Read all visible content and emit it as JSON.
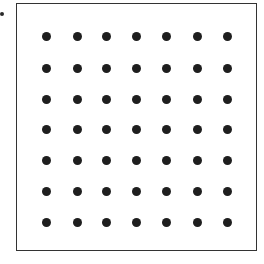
{
  "figure": {
    "frame": {
      "left": 16,
      "top": 3,
      "right": 257,
      "bottom": 251,
      "border_color": "#333333"
    },
    "stray_mark": {
      "x": 2,
      "y": 14
    },
    "grid": {
      "rows": 7,
      "cols": 7,
      "col_x": [
        46,
        77,
        106,
        136,
        166,
        197,
        227
      ],
      "row_y": [
        36,
        68,
        99,
        129,
        160,
        191,
        222
      ],
      "dot_color": "#1e1e1e",
      "dot_diameter": 9
    }
  }
}
